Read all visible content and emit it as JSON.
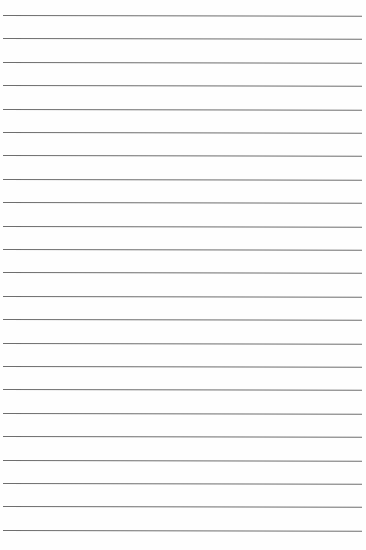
{
  "paper": {
    "type": "lined-paper",
    "line_count": 23,
    "first_line_y": 15,
    "line_spacing": 23.4,
    "line_color": "#6e6e6e",
    "background_color": "#fefefe"
  }
}
